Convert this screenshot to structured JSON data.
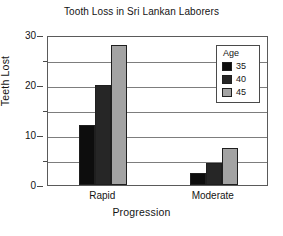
{
  "chart_data": {
    "type": "bar",
    "title": "Tooth Loss in Sri Lankan Laborers",
    "xlabel": "Progression",
    "ylabel": "Teeth Lost",
    "categories": [
      "Rapid",
      "Moderate"
    ],
    "series": [
      {
        "name": "35",
        "values": [
          12,
          2.5
        ],
        "color": "#0d0d0d"
      },
      {
        "name": "40",
        "values": [
          20,
          4.5
        ],
        "color": "#262626"
      },
      {
        "name": "45",
        "values": [
          28,
          7.5
        ],
        "color": "#a3a3a3"
      }
    ],
    "legend": {
      "title": "Age",
      "position": "top-right",
      "entries": [
        "35",
        "40",
        "45"
      ]
    },
    "ylim": [
      0,
      30
    ],
    "yticks": [
      0,
      10,
      20,
      30
    ],
    "yticks_minor": [
      5,
      15,
      25
    ],
    "ytick_labels": [
      "0",
      "10",
      "20",
      "30"
    ],
    "grid": true,
    "grid_axis": "y"
  }
}
